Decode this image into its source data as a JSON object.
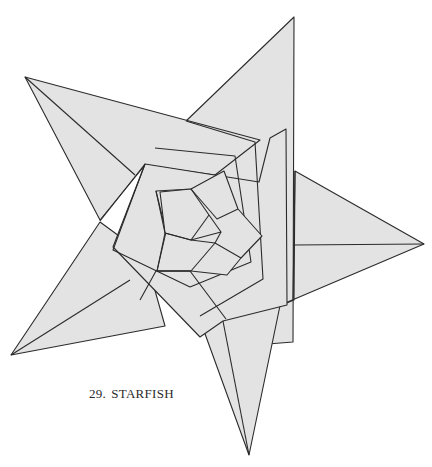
{
  "caption": {
    "number": "29.",
    "title": "STARFISH"
  },
  "colors": {
    "background": "#ffffff",
    "paper_fill": "#e3e3e3",
    "line": "#2b2b2b"
  },
  "diagram": {
    "tips": {
      "top": [
        294,
        17
      ],
      "right": [
        424,
        244
      ],
      "bottom": [
        249,
        455
      ],
      "bottom_left": [
        11,
        355
      ],
      "top_left": [
        25,
        77
      ]
    }
  }
}
